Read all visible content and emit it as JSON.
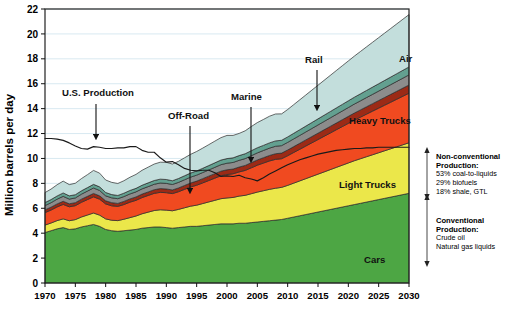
{
  "chart_data": {
    "type": "area",
    "title": "",
    "xlabel": "",
    "ylabel": "Million barrels per day",
    "xlim": [
      1970,
      2030
    ],
    "ylim": [
      0,
      22
    ],
    "ytick_step": 2,
    "xtick_step": 5,
    "xticks": [
      1970,
      1975,
      1980,
      1985,
      1990,
      1995,
      2000,
      2005,
      2010,
      2015,
      2020,
      2025,
      2030
    ],
    "yticks": [
      0,
      2,
      4,
      6,
      8,
      10,
      12,
      14,
      16,
      18,
      20,
      22
    ],
    "grid": "horizontal",
    "legend": "inline-labels",
    "stacked": true,
    "x": [
      1970,
      1971,
      1972,
      1973,
      1974,
      1975,
      1976,
      1977,
      1978,
      1979,
      1980,
      1981,
      1982,
      1983,
      1984,
      1985,
      1986,
      1987,
      1988,
      1989,
      1990,
      1991,
      1992,
      1993,
      1994,
      1995,
      1996,
      1997,
      1998,
      1999,
      2000,
      2001,
      2002,
      2003,
      2004,
      2005,
      2006,
      2007,
      2008,
      2009,
      2010,
      2011,
      2012,
      2013,
      2014,
      2015,
      2016,
      2017,
      2018,
      2019,
      2020,
      2021,
      2022,
      2023,
      2024,
      2025,
      2026,
      2027,
      2028,
      2029,
      2030
    ],
    "series": [
      {
        "name": "Cars",
        "color": "#4DA644",
        "label": "Cars",
        "values": [
          4.05,
          4.2,
          4.35,
          4.45,
          4.3,
          4.35,
          4.5,
          4.6,
          4.7,
          4.55,
          4.3,
          4.2,
          4.15,
          4.2,
          4.25,
          4.3,
          4.4,
          4.45,
          4.5,
          4.5,
          4.45,
          4.4,
          4.45,
          4.5,
          4.55,
          4.55,
          4.6,
          4.65,
          4.7,
          4.75,
          4.75,
          4.75,
          4.8,
          4.8,
          4.85,
          4.9,
          4.95,
          5.0,
          5.05,
          5.1,
          5.2,
          5.3,
          5.4,
          5.5,
          5.6,
          5.7,
          5.8,
          5.9,
          6.0,
          6.1,
          6.2,
          6.3,
          6.4,
          6.5,
          6.6,
          6.7,
          6.8,
          6.9,
          7.0,
          7.1,
          7.2
        ]
      },
      {
        "name": "Light Trucks",
        "color": "#EBE74A",
        "label": "Light Trucks",
        "values": [
          0.6,
          0.62,
          0.66,
          0.7,
          0.7,
          0.74,
          0.8,
          0.86,
          0.92,
          0.9,
          0.85,
          0.84,
          0.86,
          0.92,
          1.0,
          1.08,
          1.16,
          1.24,
          1.32,
          1.38,
          1.4,
          1.4,
          1.46,
          1.54,
          1.62,
          1.7,
          1.78,
          1.86,
          1.94,
          2.02,
          2.08,
          2.12,
          2.18,
          2.24,
          2.32,
          2.4,
          2.46,
          2.52,
          2.56,
          2.58,
          2.64,
          2.72,
          2.8,
          2.88,
          2.96,
          3.04,
          3.12,
          3.2,
          3.28,
          3.36,
          3.44,
          3.52,
          3.58,
          3.64,
          3.7,
          3.76,
          3.82,
          3.88,
          3.94,
          4.0,
          4.06
        ]
      },
      {
        "name": "Heavy Trucks",
        "color": "#F04A20",
        "label": "Heavy Trucks",
        "values": [
          1.0,
          1.04,
          1.1,
          1.16,
          1.12,
          1.12,
          1.18,
          1.24,
          1.3,
          1.28,
          1.2,
          1.16,
          1.14,
          1.18,
          1.24,
          1.26,
          1.3,
          1.34,
          1.38,
          1.4,
          1.4,
          1.38,
          1.42,
          1.48,
          1.54,
          1.6,
          1.66,
          1.72,
          1.78,
          1.84,
          1.88,
          1.9,
          1.94,
          2.0,
          2.08,
          2.16,
          2.22,
          2.28,
          2.32,
          2.3,
          2.38,
          2.46,
          2.54,
          2.62,
          2.7,
          2.78,
          2.86,
          2.94,
          3.02,
          3.1,
          3.18,
          3.26,
          3.34,
          3.42,
          3.5,
          3.58,
          3.66,
          3.74,
          3.82,
          3.9,
          3.98
        ]
      },
      {
        "name": "Off-Road",
        "color": "#9C2A16",
        "label": "Off-Road",
        "values": [
          0.22,
          0.23,
          0.24,
          0.25,
          0.24,
          0.24,
          0.25,
          0.26,
          0.27,
          0.27,
          0.25,
          0.25,
          0.24,
          0.25,
          0.26,
          0.27,
          0.28,
          0.28,
          0.29,
          0.3,
          0.3,
          0.29,
          0.3,
          0.31,
          0.32,
          0.33,
          0.34,
          0.35,
          0.36,
          0.37,
          0.38,
          0.38,
          0.39,
          0.4,
          0.41,
          0.42,
          0.43,
          0.44,
          0.45,
          0.45,
          0.46,
          0.47,
          0.48,
          0.49,
          0.5,
          0.51,
          0.52,
          0.53,
          0.54,
          0.55,
          0.56,
          0.57,
          0.58,
          0.59,
          0.6,
          0.61,
          0.62,
          0.63,
          0.64,
          0.65,
          0.66
        ]
      },
      {
        "name": "Marine",
        "color": "#8C8C8C",
        "label": "Marine",
        "values": [
          0.35,
          0.36,
          0.38,
          0.4,
          0.38,
          0.38,
          0.4,
          0.42,
          0.44,
          0.43,
          0.4,
          0.39,
          0.38,
          0.39,
          0.4,
          0.41,
          0.42,
          0.43,
          0.44,
          0.45,
          0.45,
          0.44,
          0.45,
          0.46,
          0.47,
          0.48,
          0.49,
          0.5,
          0.51,
          0.52,
          0.53,
          0.53,
          0.54,
          0.55,
          0.56,
          0.57,
          0.58,
          0.59,
          0.6,
          0.6,
          0.61,
          0.62,
          0.63,
          0.64,
          0.65,
          0.66,
          0.67,
          0.68,
          0.69,
          0.7,
          0.71,
          0.72,
          0.73,
          0.74,
          0.75,
          0.76,
          0.77,
          0.78,
          0.79,
          0.8,
          0.81
        ]
      },
      {
        "name": "Rail",
        "color": "#63A090",
        "label": "Rail",
        "values": [
          0.24,
          0.25,
          0.26,
          0.27,
          0.26,
          0.26,
          0.27,
          0.28,
          0.29,
          0.29,
          0.27,
          0.26,
          0.26,
          0.27,
          0.28,
          0.28,
          0.29,
          0.3,
          0.3,
          0.31,
          0.31,
          0.3,
          0.31,
          0.32,
          0.33,
          0.34,
          0.34,
          0.35,
          0.36,
          0.37,
          0.37,
          0.37,
          0.38,
          0.39,
          0.4,
          0.41,
          0.41,
          0.42,
          0.43,
          0.43,
          0.44,
          0.45,
          0.46,
          0.47,
          0.48,
          0.49,
          0.5,
          0.51,
          0.52,
          0.53,
          0.54,
          0.55,
          0.56,
          0.57,
          0.58,
          0.59,
          0.6,
          0.61,
          0.62,
          0.63,
          0.64
        ]
      },
      {
        "name": "Air",
        "color": "#C3DEDC",
        "label": "Air",
        "values": [
          0.8,
          0.84,
          0.9,
          0.95,
          0.9,
          0.92,
          0.98,
          1.04,
          1.12,
          1.1,
          1.0,
          0.98,
          0.96,
          1.0,
          1.06,
          1.12,
          1.2,
          1.26,
          1.32,
          1.36,
          1.38,
          1.34,
          1.38,
          1.44,
          1.5,
          1.56,
          1.62,
          1.68,
          1.74,
          1.8,
          1.86,
          1.8,
          1.78,
          1.84,
          1.94,
          2.02,
          2.08,
          2.14,
          2.16,
          2.12,
          2.2,
          2.3,
          2.4,
          2.5,
          2.6,
          2.7,
          2.8,
          2.9,
          3.0,
          3.1,
          3.2,
          3.3,
          3.4,
          3.5,
          3.6,
          3.7,
          3.8,
          3.9,
          4.0,
          4.1,
          4.2
        ]
      }
    ],
    "line_series": {
      "name": "U.S. Production",
      "label": "U.S. Production",
      "color": "#1a1a1a",
      "values": [
        11.6,
        11.6,
        11.55,
        11.45,
        11.25,
        11.0,
        10.8,
        10.75,
        10.95,
        10.9,
        10.8,
        10.8,
        10.85,
        10.85,
        10.95,
        10.95,
        10.65,
        10.5,
        10.5,
        10.05,
        9.7,
        9.75,
        9.5,
        9.2,
        9.05,
        9.0,
        9.05,
        9.05,
        8.85,
        8.55,
        8.6,
        8.55,
        8.65,
        8.45,
        8.35,
        8.2,
        8.45,
        8.75,
        9.0,
        9.25,
        9.5,
        9.7,
        9.9,
        10.05,
        10.2,
        10.35,
        10.45,
        10.55,
        10.65,
        10.7,
        10.75,
        10.8,
        10.8,
        10.85,
        10.85,
        10.9,
        10.9,
        10.9,
        10.9,
        10.9,
        10.9
      ]
    },
    "annotations": [
      {
        "id": "us-production",
        "text": "U.S. Production",
        "label_x": 62,
        "label_y": 96,
        "arrow_x": 96,
        "arrow_y0": 104,
        "arrow_y1": 142
      },
      {
        "id": "off-road",
        "text": "Off-Road",
        "label_x": 168,
        "label_y": 119,
        "arrow_x": 190,
        "arrow_y0": 126,
        "arrow_y1": 196
      },
      {
        "id": "marine",
        "text": "Marine",
        "label_x": 231,
        "label_y": 100,
        "arrow_x": 251,
        "arrow_y0": 107,
        "arrow_y1": 165
      },
      {
        "id": "rail",
        "text": "Rail",
        "label_x": 305,
        "label_y": 63,
        "arrow_x": 317,
        "arrow_y0": 70,
        "arrow_y1": 113
      },
      {
        "id": "air",
        "text": "Air",
        "label_x": 399,
        "label_y": 62
      },
      {
        "id": "heavy-trucks",
        "text": "Heavy Trucks",
        "label_x": 349,
        "label_y": 124
      },
      {
        "id": "light-trucks",
        "text": "Light Trucks",
        "label_x": 339,
        "label_y": 188
      },
      {
        "id": "cars",
        "text": "Cars",
        "label_x": 364,
        "label_y": 263
      }
    ],
    "side_notes": {
      "nonconventional": {
        "heading_line1": "Non-conventional",
        "heading_line2": "Production:",
        "items": [
          "53% coal-to-liquids",
          "29% biofuels",
          "18% shale, GTL"
        ]
      },
      "conventional": {
        "heading_line1": "Conventional",
        "heading_line2": "Production:",
        "items": [
          "Crude oil",
          "Natural gas liquids"
        ]
      }
    }
  },
  "colors": {
    "cars": "#4DA644",
    "light_trucks": "#EBE74A",
    "heavy_trucks": "#F04A20",
    "off_road": "#9C2A16",
    "marine": "#8C8C8C",
    "rail": "#63A090",
    "air": "#C3DEDC",
    "line": "#1a1a1a",
    "grid": "#cfe3ee",
    "axis": "#000000",
    "background": "#ffffff"
  }
}
